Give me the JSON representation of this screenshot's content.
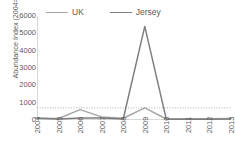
{
  "chart_data": {
    "type": "line",
    "title": "",
    "xlabel": "",
    "ylabel": "Abundance Index (2004=100)",
    "categories": [
      "2004",
      "2005",
      "2006",
      "2007",
      "2008",
      "2009",
      "2010",
      "2011",
      "2012",
      "2013"
    ],
    "ylim": [
      0,
      6000
    ],
    "yticks": [
      0,
      1000,
      2000,
      3000,
      4000,
      5000,
      6000
    ],
    "ytick_labels": [
      "0",
      "1000",
      "2000",
      "3000",
      "4000",
      "5000",
      "6000"
    ],
    "grid": false,
    "legend_position": "top",
    "series": [
      {
        "name": "UK",
        "color": "#a6a6a6",
        "values": [
          100,
          90,
          600,
          180,
          100,
          700,
          60,
          70,
          70,
          80
        ]
      },
      {
        "name": "Jersey",
        "color": "#7f7f7f",
        "values": [
          100,
          60,
          120,
          110,
          60,
          5400,
          40,
          50,
          50,
          60
        ]
      }
    ],
    "reference_line": {
      "name": "threshold",
      "value": 700,
      "style": "dotted",
      "color": "#a6a6a6"
    }
  },
  "legend": {
    "items": [
      {
        "label": "UK",
        "swatch": "line-swatch-uk"
      },
      {
        "label": "Jersey",
        "swatch": "line-swatch-jersey"
      }
    ]
  }
}
